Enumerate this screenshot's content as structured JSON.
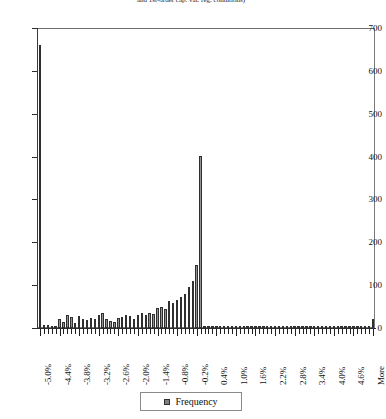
{
  "chart_data": {
    "type": "bar",
    "title": "and 1st-order cap. var. reg. conditions)",
    "xlabel": "",
    "ylabel": "",
    "ylim": [
      0,
      700
    ],
    "ytick_values": [
      0,
      100,
      200,
      300,
      400,
      500,
      600,
      700
    ],
    "ytick_labels": [
      "0",
      "100",
      "200",
      "300",
      "400",
      "500",
      "600",
      "700"
    ],
    "grid": false,
    "legend_position": "bottom",
    "legend": [
      "Frequency"
    ],
    "series_name": "Frequency",
    "bin_labels_shown": [
      "-5.0%",
      "-4.4%",
      "-3.8%",
      "-3.2%",
      "-2.6%",
      "-2.0%",
      "-1.4%",
      "-0.8%",
      "-0.2%",
      "0.4%",
      "1.0%",
      "1.6%",
      "2.2%",
      "2.8%",
      "3.4%",
      "4.0%",
      "4.6%",
      "More"
    ],
    "label_every_n_bins": 5,
    "categories": [
      "-5.0%",
      "-4.9%",
      "-4.8%",
      "-4.7%",
      "-4.6%",
      "-4.4%",
      "-4.3%",
      "-4.2%",
      "-4.1%",
      "-4.0%",
      "-3.8%",
      "-3.7%",
      "-3.6%",
      "-3.5%",
      "-3.4%",
      "-3.2%",
      "-3.1%",
      "-3.0%",
      "-2.9%",
      "-2.8%",
      "-2.6%",
      "-2.5%",
      "-2.4%",
      "-2.3%",
      "-2.2%",
      "-2.0%",
      "-1.9%",
      "-1.8%",
      "-1.7%",
      "-1.6%",
      "-1.4%",
      "-1.3%",
      "-1.2%",
      "-1.1%",
      "-1.0%",
      "-0.8%",
      "-0.7%",
      "-0.6%",
      "-0.5%",
      "-0.4%",
      "-0.2%",
      "-0.1%",
      "0.0%",
      "0.1%",
      "0.2%",
      "0.4%",
      "0.5%",
      "0.6%",
      "0.7%",
      "0.8%",
      "1.0%",
      "1.1%",
      "1.2%",
      "1.3%",
      "1.4%",
      "1.6%",
      "1.7%",
      "1.8%",
      "1.9%",
      "2.0%",
      "2.2%",
      "2.3%",
      "2.4%",
      "2.5%",
      "2.6%",
      "2.8%",
      "2.9%",
      "3.0%",
      "3.1%",
      "3.2%",
      "3.4%",
      "3.5%",
      "3.6%",
      "3.7%",
      "3.8%",
      "4.0%",
      "4.1%",
      "4.2%",
      "4.3%",
      "4.4%",
      "4.6%",
      "4.7%",
      "4.8%",
      "4.9%",
      "5.0%",
      "More"
    ],
    "values": [
      660,
      8,
      6,
      5,
      4,
      22,
      14,
      30,
      26,
      12,
      28,
      22,
      18,
      24,
      20,
      30,
      34,
      22,
      16,
      14,
      24,
      26,
      30,
      28,
      22,
      30,
      34,
      30,
      36,
      32,
      46,
      50,
      44,
      62,
      58,
      66,
      72,
      80,
      96,
      110,
      148,
      402,
      2,
      1,
      1,
      1,
      1,
      1,
      1,
      1,
      1,
      1,
      1,
      1,
      1,
      1,
      1,
      1,
      1,
      1,
      1,
      1,
      1,
      1,
      1,
      1,
      1,
      1,
      1,
      1,
      1,
      1,
      1,
      1,
      1,
      1,
      1,
      1,
      1,
      1,
      1,
      1,
      1,
      1,
      1,
      20
    ]
  }
}
